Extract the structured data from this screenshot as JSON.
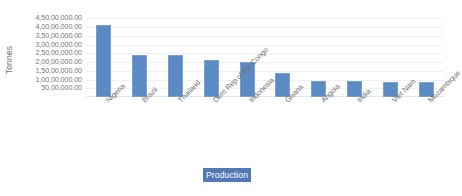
{
  "chart_data": {
    "type": "bar",
    "title": "",
    "xlabel": "",
    "ylabel": "Tonnes",
    "categories": [
      "Nigeria",
      "Brazil",
      "Thailand",
      "Dem Rep of the Congo",
      "Indonesia",
      "Ghana",
      "Angola",
      "India",
      "Viet Nam",
      "Mozambique"
    ],
    "series": [
      {
        "name": "Production",
        "values": [
          41000000,
          24000000,
          24000000,
          21000000,
          20000000,
          14000000,
          9000000,
          9000000,
          8500000,
          8500000
        ]
      }
    ],
    "ylim": [
      0,
      47500000
    ],
    "ytick_values": [
      5000000,
      10000000,
      15000000,
      20000000,
      25000000,
      30000000,
      35000000,
      40000000,
      45000000
    ],
    "ytick_labels": [
      "50,00,000.00",
      "1,00,00,000.00",
      "1,50,00,000.00",
      "2,00,00,000.00",
      "2,50,00,000.00",
      "3,00,00,000.00",
      "3,50,00,000.00",
      "4,00,00,000.00",
      "4,50,00,000.00"
    ],
    "grid": true,
    "legend_position": "bottom",
    "legend_entries": [
      "Production"
    ],
    "colors": {
      "bar_fill": "#5b8bc4",
      "bar_border": "#7ba0cd",
      "gridline": "#eef0f3",
      "axis_text": "#757575",
      "legend_highlight": "#5278b8",
      "legend_text": "#ffffff",
      "background": "#ffffff"
    }
  }
}
